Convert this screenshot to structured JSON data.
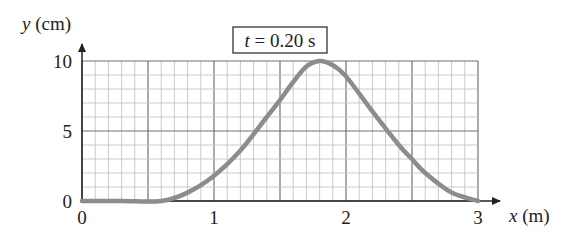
{
  "chart_data": {
    "type": "line",
    "title": "t = 0.20 s",
    "title_parts": {
      "var": "t",
      "rest": " = 0.20 s"
    },
    "xlabel": "x (m)",
    "xlabel_parts": {
      "var": "x",
      "unit": " (m)"
    },
    "ylabel": "y (cm)",
    "ylabel_parts": {
      "var": "y",
      "unit": " (cm)"
    },
    "xlim": [
      0,
      3
    ],
    "ylim": [
      0,
      10
    ],
    "x_ticks": [
      "0",
      "1",
      "2",
      "3"
    ],
    "y_ticks": [
      "0",
      "5",
      "10"
    ],
    "grid": true,
    "grid_minor_x": 0.1,
    "grid_major_x": 0.5,
    "grid_minor_y": 1,
    "grid_major_y": 5,
    "series": [
      {
        "name": "wave pulse",
        "color": "#8c8c8c",
        "x": [
          0,
          0.3,
          0.6,
          0.8,
          1.0,
          1.2,
          1.4,
          1.5,
          1.6,
          1.7,
          1.8,
          1.9,
          2.0,
          2.2,
          2.4,
          2.5,
          2.6,
          2.8,
          3.0
        ],
        "y": [
          0,
          0,
          0,
          0.6,
          1.8,
          3.6,
          6.0,
          7.2,
          8.5,
          9.6,
          10,
          9.7,
          8.9,
          6.4,
          4.0,
          3.0,
          2.0,
          0.6,
          0
        ]
      }
    ]
  }
}
